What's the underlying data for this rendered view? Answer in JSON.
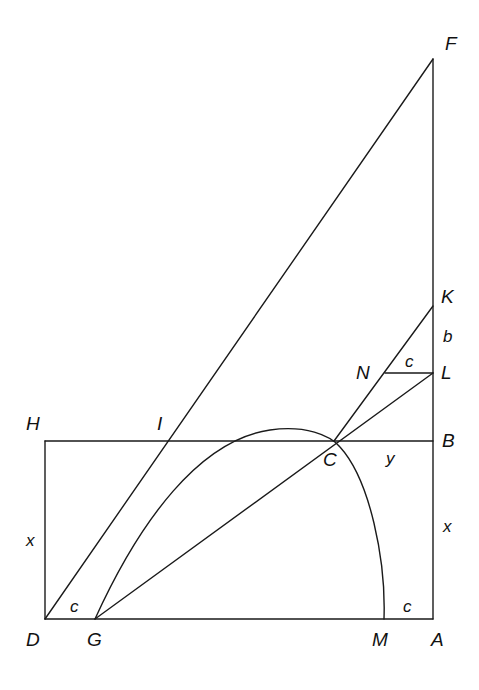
{
  "diagram": {
    "type": "geometric-construction",
    "points": {
      "F": {
        "label": "F",
        "x": 433,
        "y": 59
      },
      "K": {
        "label": "K",
        "x": 433,
        "y": 306
      },
      "L": {
        "label": "L",
        "x": 433,
        "y": 373
      },
      "N": {
        "label": "N",
        "x": 385,
        "y": 373
      },
      "H": {
        "label": "H",
        "x": 45,
        "y": 441
      },
      "I": {
        "label": "I",
        "x": 166,
        "y": 441
      },
      "C": {
        "label": "C",
        "x": 334,
        "y": 441
      },
      "B": {
        "label": "B",
        "x": 433,
        "y": 441
      },
      "D": {
        "label": "D",
        "x": 45,
        "y": 619
      },
      "G": {
        "label": "G",
        "x": 95,
        "y": 619
      },
      "M": {
        "label": "M",
        "x": 384,
        "y": 619
      },
      "A": {
        "label": "A",
        "x": 433,
        "y": 619
      }
    },
    "segment_labels": {
      "b": "b",
      "c_top": "c",
      "y": "y",
      "x_left": "x",
      "x_right": "x",
      "c_left": "c",
      "c_right": "c"
    },
    "line_color": "#1a1a1a",
    "background": "#ffffff"
  }
}
